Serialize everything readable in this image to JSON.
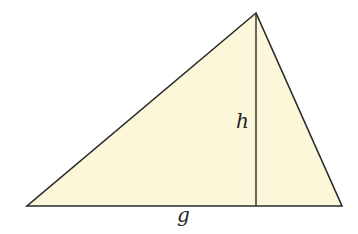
{
  "diagram": {
    "type": "triangle-with-altitude",
    "colors": {
      "fill": "#fcf7d8",
      "stroke": "#2a2a2a",
      "background": "#ffffff"
    },
    "vertices": {
      "apex": [
        256,
        13
      ],
      "left": [
        27,
        206
      ],
      "right": [
        342,
        206
      ]
    },
    "altitude": {
      "top": [
        256,
        13
      ],
      "foot": [
        256,
        206
      ]
    },
    "labels": {
      "height": "h",
      "base": "g"
    }
  }
}
